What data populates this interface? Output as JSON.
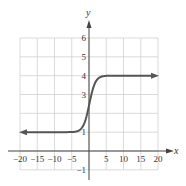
{
  "chart_data": {
    "type": "line",
    "title": "",
    "xlabel": "x",
    "ylabel": "y",
    "xlim": [
      -20,
      20
    ],
    "ylim": [
      -1,
      6
    ],
    "grid": true,
    "x_ticks": [
      -20,
      -15,
      -10,
      -5,
      5,
      10,
      15,
      20
    ],
    "x_tick_labels": [
      "−20",
      "−15",
      "−10",
      "−5",
      "5",
      "10",
      "15",
      "20"
    ],
    "y_ticks": [
      -1,
      1,
      3,
      4,
      5,
      6
    ],
    "y_tick_labels": [
      "−1",
      "1",
      "3",
      "4",
      "5",
      "6"
    ],
    "series": [
      {
        "name": "f(x)",
        "description": "Sigmoid-shaped curve: horizontal asymptote y=1 on the left, y=4 on the right, with arrowheads on both ends",
        "x": [
          -20,
          -15,
          -10,
          -5,
          -3,
          -2,
          -1,
          0,
          1,
          2,
          3,
          5,
          10,
          15,
          20
        ],
        "values": [
          1,
          1,
          1,
          1,
          1.05,
          1.2,
          1.6,
          2.5,
          3.4,
          3.8,
          3.95,
          4,
          4,
          4,
          4
        ]
      }
    ],
    "colors": {
      "curve": "#555555",
      "grid": "#d0d0d0",
      "axes": "#444444"
    }
  }
}
